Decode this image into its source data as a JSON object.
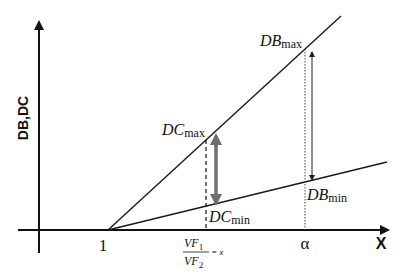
{
  "diagram": {
    "y_axis_label": "DB,DC",
    "x_axis_label": "X",
    "x_ticks": {
      "one": "1",
      "alpha": "α"
    },
    "fraction": {
      "numerator_base": "VF",
      "numerator_sub": "1",
      "denominator_base": "VF",
      "denominator_sub": "2",
      "equals": "= x"
    },
    "labels": {
      "db_max_base": "DB",
      "db_max_sub": "max",
      "db_min_base": "DB",
      "db_min_sub": "min",
      "dc_max_base": "DC",
      "dc_max_sub": "max",
      "dc_min_base": "DC",
      "dc_min_sub": "min"
    },
    "colors": {
      "line": "#1a1a1a",
      "range_arrow": "#6e6e6e"
    }
  }
}
